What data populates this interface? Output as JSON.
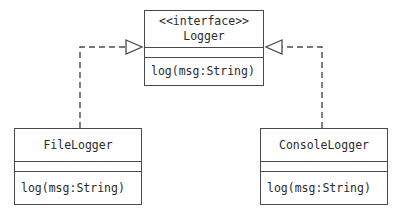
{
  "diagram": {
    "type": "uml-class-diagram",
    "background_color": "#ffffff",
    "line_color": "#4a4a4a",
    "text_color": "#2b2b2b"
  },
  "nodes": {
    "logger": {
      "kind": "interface",
      "stereotype": "<<interface>>",
      "name": "Logger",
      "attributes": [],
      "operations": [
        "log(msg:String)"
      ]
    },
    "filelogger": {
      "kind": "class",
      "name": "FileLogger",
      "attributes": [],
      "operations": [
        "log(msg:String)"
      ]
    },
    "consolelogger": {
      "kind": "class",
      "name": "ConsoleLogger",
      "attributes": [],
      "operations": [
        "log(msg:String)"
      ]
    }
  },
  "edges": [
    {
      "id": "filelogger-realizes-logger",
      "relation": "realization",
      "line_style": "dashed",
      "arrowhead": "hollow-triangle",
      "source": "FileLogger",
      "target": "Logger",
      "label": ""
    },
    {
      "id": "consolelogger-realizes-logger",
      "relation": "realization",
      "line_style": "dashed",
      "arrowhead": "hollow-triangle",
      "source": "ConsoleLogger",
      "target": "Logger",
      "label": ""
    }
  ]
}
